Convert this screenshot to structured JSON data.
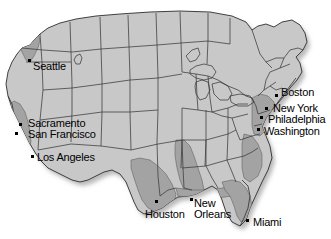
{
  "map": {
    "title": "United States city map",
    "background_color": "#ffffff",
    "land_fill": "#c8c8c8",
    "highlight_fill": "#a0a0a0",
    "border_color": "#333333",
    "shadow_color": "#bfbfbf",
    "marker_color": "#000000",
    "label_color": "#000000"
  },
  "cities": [
    {
      "name": "Seattle",
      "label": "Seattle",
      "dot_x": 28,
      "dot_y": 59,
      "label_x": 33,
      "label_y": 61,
      "multiline": false
    },
    {
      "name": "Sacramento",
      "label": "Sacramento",
      "dot_x": 19,
      "dot_y": 123,
      "label_x": 28,
      "label_y": 118,
      "multiline": false
    },
    {
      "name": "San Francisco",
      "label": "San Francisco",
      "dot_x": 15,
      "dot_y": 132,
      "label_x": 28,
      "label_y": 129,
      "multiline": false
    },
    {
      "name": "Los Angeles",
      "label": "Los Angeles",
      "dot_x": 31,
      "dot_y": 155,
      "label_x": 37,
      "label_y": 152,
      "multiline": false
    },
    {
      "name": "Boston",
      "label": "Boston",
      "dot_x": 275,
      "dot_y": 94,
      "label_x": 281,
      "label_y": 87,
      "multiline": false
    },
    {
      "name": "New York",
      "label": "New York",
      "dot_x": 265,
      "dot_y": 107,
      "label_x": 273,
      "label_y": 103,
      "multiline": false
    },
    {
      "name": "Philadelphia",
      "label": "Philadelphia",
      "dot_x": 260,
      "dot_y": 116,
      "label_x": 268,
      "label_y": 114,
      "multiline": false
    },
    {
      "name": "Washington",
      "label": "Washington",
      "dot_x": 257,
      "dot_y": 128,
      "label_x": 264,
      "label_y": 126,
      "multiline": false
    },
    {
      "name": "Houston",
      "label": "Houston",
      "dot_x": 155,
      "dot_y": 200,
      "label_x": 145,
      "label_y": 209,
      "multiline": false
    },
    {
      "name": "New Orleans",
      "label": "New Orleans",
      "dot_x": 190,
      "dot_y": 198,
      "label_x": 194,
      "label_y": 198,
      "multiline": true
    },
    {
      "name": "Miami",
      "label": "Miami",
      "dot_x": 246,
      "dot_y": 219,
      "label_x": 253,
      "label_y": 217,
      "multiline": false
    }
  ]
}
